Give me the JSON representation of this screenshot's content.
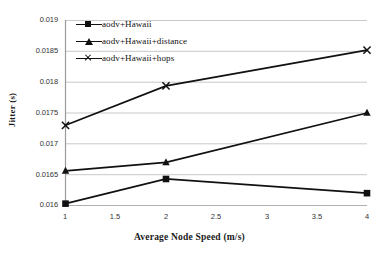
{
  "chart_data": {
    "type": "line",
    "title": "",
    "xlabel": "Average Node Speed (m/s)",
    "ylabel": "Jitter (s)",
    "x": [
      1,
      2,
      4
    ],
    "xlim": [
      1,
      4
    ],
    "ylim": [
      0.016,
      0.019
    ],
    "xticks": [
      "1",
      "1.5",
      "2",
      "2.5",
      "3",
      "3.5",
      "4"
    ],
    "xtick_values": [
      1,
      1.5,
      2,
      2.5,
      3,
      3.5,
      4
    ],
    "yticks": [
      "0.016",
      "0.0165",
      "0.017",
      "0.0175",
      "0.018",
      "0.0185",
      "0.019"
    ],
    "ytick_values": [
      0.016,
      0.0165,
      0.017,
      0.0175,
      0.018,
      0.0185,
      0.019
    ],
    "grid": "horizontal",
    "legend_position": "top-left-inside",
    "series": [
      {
        "name": "aodv+Hawaii",
        "marker": "square",
        "color": "#111111",
        "values": [
          0.01603,
          0.01643,
          0.0162
        ]
      },
      {
        "name": "aodv+Hawaii+distance",
        "marker": "triangle",
        "color": "#111111",
        "values": [
          0.01656,
          0.0167,
          0.0175
        ]
      },
      {
        "name": "aodv+Hawaii+hops",
        "marker": "x",
        "color": "#111111",
        "values": [
          0.0173,
          0.01794,
          0.01852
        ]
      }
    ]
  },
  "axis": {
    "y_label": "Jitter (s)",
    "x_label": "Average Node Speed (m/s)"
  },
  "legend": {
    "items": [
      {
        "label": "aodv+Hawaii",
        "marker": "square-marker"
      },
      {
        "label": "aodv+Hawaii+distance",
        "marker": "triangle-marker"
      },
      {
        "label": "aodv+Hawaii+hops",
        "marker": "x-marker"
      }
    ]
  },
  "colors": {
    "line": "#111111",
    "grid": "#c9c9c9",
    "axis": "#9a9a9a",
    "text": "#333333",
    "background": "#ffffff"
  }
}
